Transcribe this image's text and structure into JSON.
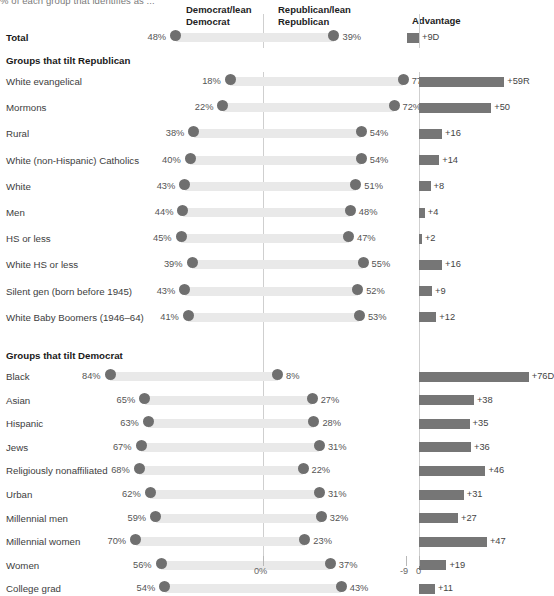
{
  "subtitle": "% of each group that identifies as ...",
  "headers": {
    "dem": "Democrat/lean\nDemocrat",
    "dem_line1": "Democrat/lean",
    "dem_line2": "Democrat",
    "rep_line1": "Republican/lean",
    "rep_line2": "Republican",
    "advantage": "Advantage"
  },
  "sections": {
    "republican": "Groups that tilt Republican",
    "democrat": "Groups that tilt Democrat"
  },
  "axis": {
    "left_zero": "0%",
    "adv_neg9": "-9",
    "adv_zero": "0"
  },
  "colors": {
    "track": "#e9e9e9",
    "dot": "#6f6f6f",
    "advbar": "#767676",
    "zeroline": "#cfcfcf",
    "text": "#3d3d3d"
  },
  "chart_data": {
    "type": "bar",
    "subtitle": "% of each group that identifies as ...",
    "xlabel": "",
    "ylabel": "",
    "series": [
      {
        "name": "Democrat/lean Democrat"
      },
      {
        "name": "Republican/lean Republican"
      },
      {
        "name": "Advantage"
      }
    ],
    "axis_ranges": {
      "party_pct": [
        0,
        90
      ],
      "advantage": [
        -9,
        80
      ]
    },
    "grid": false,
    "legend": "column-headers",
    "rows": [
      {
        "group": "total",
        "label": "Total",
        "dem": 48,
        "rep": 39,
        "dem_label": "48%",
        "rep_label": "39%",
        "advantage": 9,
        "advantage_label": "+9D"
      },
      {
        "group": "rep",
        "label": "White evangelical",
        "dem": 18,
        "rep": 77,
        "dem_label": "18%",
        "rep_label": "77%",
        "advantage": 59,
        "advantage_label": "+59R"
      },
      {
        "group": "rep",
        "label": "Mormons",
        "dem": 22,
        "rep": 72,
        "dem_label": "22%",
        "rep_label": "72%",
        "advantage": 50,
        "advantage_label": "+50"
      },
      {
        "group": "rep",
        "label": "Rural",
        "dem": 38,
        "rep": 54,
        "dem_label": "38%",
        "rep_label": "54%",
        "advantage": 16,
        "advantage_label": "+16"
      },
      {
        "group": "rep",
        "label": "White (non-Hispanic) Catholics",
        "dem": 40,
        "rep": 54,
        "dem_label": "40%",
        "rep_label": "54%",
        "advantage": 14,
        "advantage_label": "+14"
      },
      {
        "group": "rep",
        "label": "White",
        "dem": 43,
        "rep": 51,
        "dem_label": "43%",
        "rep_label": "51%",
        "advantage": 8,
        "advantage_label": "+8"
      },
      {
        "group": "rep",
        "label": "Men",
        "dem": 44,
        "rep": 48,
        "dem_label": "44%",
        "rep_label": "48%",
        "advantage": 4,
        "advantage_label": "+4"
      },
      {
        "group": "rep",
        "label": "HS or less",
        "dem": 45,
        "rep": 47,
        "dem_label": "45%",
        "rep_label": "47%",
        "advantage": 2,
        "advantage_label": "+2"
      },
      {
        "group": "rep",
        "label": "White HS or less",
        "dem": 39,
        "rep": 55,
        "dem_label": "39%",
        "rep_label": "55%",
        "advantage": 16,
        "advantage_label": "+16"
      },
      {
        "group": "rep",
        "label": "Silent gen (born before 1945)",
        "dem": 43,
        "rep": 52,
        "dem_label": "43%",
        "rep_label": "52%",
        "advantage": 9,
        "advantage_label": "+9"
      },
      {
        "group": "rep",
        "label": "White Baby Boomers (1946–64)",
        "dem": 41,
        "rep": 53,
        "dem_label": "41%",
        "rep_label": "53%",
        "advantage": 12,
        "advantage_label": "+12"
      },
      {
        "group": "dem",
        "label": "Black",
        "dem": 84,
        "rep": 8,
        "dem_label": "84%",
        "rep_label": "8%",
        "advantage": 76,
        "advantage_label": "+76D"
      },
      {
        "group": "dem",
        "label": "Asian",
        "dem": 65,
        "rep": 27,
        "dem_label": "65%",
        "rep_label": "27%",
        "advantage": 38,
        "advantage_label": "+38"
      },
      {
        "group": "dem",
        "label": "Hispanic",
        "dem": 63,
        "rep": 28,
        "dem_label": "63%",
        "rep_label": "28%",
        "advantage": 35,
        "advantage_label": "+35"
      },
      {
        "group": "dem",
        "label": "Jews",
        "dem": 67,
        "rep": 31,
        "dem_label": "67%",
        "rep_label": "31%",
        "advantage": 36,
        "advantage_label": "+36"
      },
      {
        "group": "dem",
        "label": "Religiously nonaffiliated",
        "dem": 68,
        "rep": 22,
        "dem_label": "68%",
        "rep_label": "22%",
        "advantage": 46,
        "advantage_label": "+46"
      },
      {
        "group": "dem",
        "label": "Urban",
        "dem": 62,
        "rep": 31,
        "dem_label": "62%",
        "rep_label": "31%",
        "advantage": 31,
        "advantage_label": "+31"
      },
      {
        "group": "dem",
        "label": "Millennial men",
        "dem": 59,
        "rep": 32,
        "dem_label": "59%",
        "rep_label": "32%",
        "advantage": 27,
        "advantage_label": "+27"
      },
      {
        "group": "dem",
        "label": "Millennial women",
        "dem": 70,
        "rep": 23,
        "dem_label": "70%",
        "rep_label": "23%",
        "advantage": 47,
        "advantage_label": "+47"
      },
      {
        "group": "dem",
        "label": "Women",
        "dem": 56,
        "rep": 37,
        "dem_label": "56%",
        "rep_label": "37%",
        "advantage": 19,
        "advantage_label": "+19"
      },
      {
        "group": "dem",
        "label": "College grad",
        "dem": 54,
        "rep": 43,
        "dem_label": "54%",
        "rep_label": "43%",
        "advantage": 11,
        "advantage_label": "+11"
      }
    ]
  }
}
